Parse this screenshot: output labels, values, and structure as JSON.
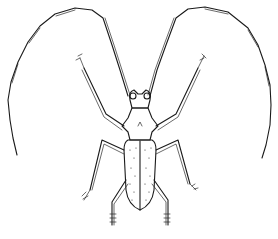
{
  "image": {
    "subject": "Line-art engraving of a longhorn beetle, dorsal view",
    "style": "black ink line drawing on white background",
    "colors": {
      "ink": "#1a1a1a",
      "background": "#ffffff"
    }
  },
  "illustration": {
    "parts": [
      "antenna-left",
      "antenna-right",
      "head",
      "pronotum",
      "elytra",
      "foreleg-left",
      "foreleg-right",
      "midleg-left",
      "midleg-right",
      "hindleg-left",
      "hindleg-right"
    ]
  },
  "caption": {
    "text": ""
  }
}
